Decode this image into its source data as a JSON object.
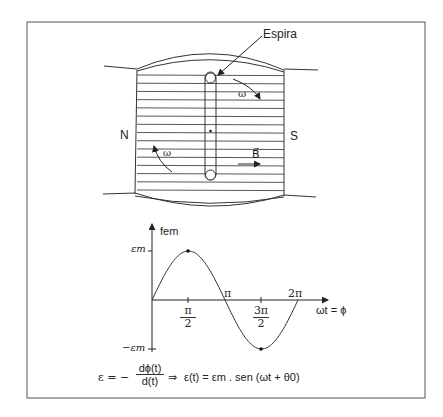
{
  "diagram": {
    "magnet": {
      "north_label": "N",
      "south_label": "S",
      "loop_label": "Espira",
      "omega_label_top": "ω",
      "omega_label_bottom": "ω",
      "field_label": "B⃗",
      "field_line_count": 15
    },
    "graph": {
      "y_axis_label": "fem",
      "x_axis_label": "ωt = ϕ",
      "y_max_label": "εm",
      "y_min_label": "−εm",
      "x_ticks": [
        {
          "num": "π",
          "den": "2"
        },
        {
          "label": "π"
        },
        {
          "num": "3π",
          "den": "2"
        },
        {
          "label": "2π"
        }
      ]
    },
    "formula": {
      "lhs": "ε = −",
      "frac_num": "dϕ(t)",
      "frac_den": "d(t)",
      "implies": "⇒",
      "rhs": "ε(t) = εm . sen (ωt + θ0)"
    }
  },
  "chart_data": {
    "type": "line",
    "title": "",
    "xlabel": "ωt = ϕ",
    "ylabel": "fem",
    "x_ticks": [
      "π/2",
      "π",
      "3π/2",
      "2π"
    ],
    "y_ticks": [
      "εm",
      "−εm"
    ],
    "series": [
      {
        "name": "fem = εm·sen(ωt)",
        "x": [
          0,
          0.7854,
          1.5708,
          2.3562,
          3.1416,
          3.927,
          4.7124,
          5.4978,
          6.2832
        ],
        "values": [
          0,
          0.707,
          1,
          0.707,
          0,
          -0.707,
          -1,
          -0.707,
          0
        ]
      }
    ],
    "marked_points": [
      {
        "x": "π/2",
        "y": "εm"
      },
      {
        "x": "3π/2",
        "y": "−εm"
      }
    ],
    "ylim": [
      -1,
      1
    ],
    "grid": false
  }
}
